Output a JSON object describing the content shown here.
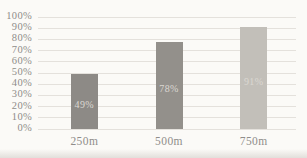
{
  "chart_data": {
    "type": "bar",
    "title": "",
    "xlabel": "",
    "ylabel": "",
    "categories": [
      "250m",
      "500m",
      "750m"
    ],
    "values": [
      49,
      78,
      91
    ],
    "value_labels": [
      "49%",
      "78%",
      "91%"
    ],
    "ylim": [
      0,
      100
    ],
    "ytick_step": 10,
    "ytick_labels": [
      "0%",
      "10%",
      "20%",
      "30%",
      "40%",
      "50%",
      "60%",
      "70%",
      "80%",
      "90%",
      "100%"
    ],
    "grid": true,
    "legend": false,
    "bar_colors": [
      "#8d8a86",
      "#93908b",
      "#c2bfb9"
    ],
    "value_label_color": "#dbd8d2"
  },
  "colors": {
    "background": "#fbfaf7",
    "gridline": "#e4e1dc",
    "axis_text": "#8f8d8a"
  }
}
